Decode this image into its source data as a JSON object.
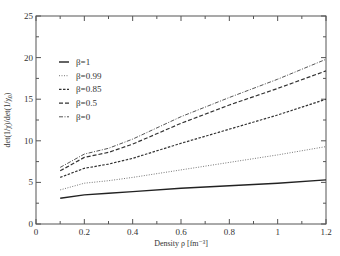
{
  "chart_data": {
    "type": "line",
    "title": "",
    "xlabel": "Density ρ [fm⁻³]",
    "ylabel": "det(1/χ)/det(1/χ₀)",
    "xlim": [
      0,
      1.2
    ],
    "ylim": [
      0,
      25
    ],
    "xticks": [
      "0",
      "0.2",
      "0.4",
      "0.6",
      "0.8",
      "1",
      "1.2"
    ],
    "yticks": [
      "0",
      "5",
      "10",
      "15",
      "20",
      "25"
    ],
    "grid": false,
    "legend_position": "upper-left",
    "x": [
      0.1,
      0.2,
      0.3,
      0.4,
      0.6,
      0.8,
      1.0,
      1.2
    ],
    "series": [
      {
        "name": "β=1",
        "style": "solid",
        "values": [
          3.1,
          3.5,
          3.7,
          3.9,
          4.3,
          4.6,
          4.9,
          5.3
        ]
      },
      {
        "name": "β=0.99",
        "style": "dotted",
        "values": [
          4.1,
          4.9,
          5.2,
          5.6,
          6.5,
          7.4,
          8.3,
          9.3
        ]
      },
      {
        "name": "β=0.85",
        "style": "dashed",
        "values": [
          5.6,
          6.7,
          7.2,
          7.9,
          9.7,
          11.4,
          13.1,
          15.0
        ]
      },
      {
        "name": "β=0.5",
        "style": "longdash",
        "values": [
          6.4,
          8.0,
          8.6,
          9.6,
          12.1,
          14.3,
          16.3,
          18.4
        ]
      },
      {
        "name": "β=0",
        "style": "dashdot",
        "values": [
          6.8,
          8.4,
          9.1,
          10.2,
          12.9,
          15.2,
          17.4,
          19.8
        ]
      }
    ]
  }
}
